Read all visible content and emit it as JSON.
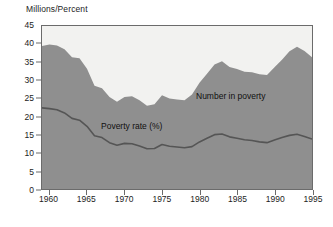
{
  "chart_data": {
    "type": "area",
    "title": "",
    "subtitle": "",
    "ylabel": "Millions/Percent",
    "xlabel": "",
    "ylim": [
      0,
      45
    ],
    "xlim": [
      1959,
      1995
    ],
    "grid": false,
    "legend_position": "inline-annotations",
    "yticks": [
      0,
      5,
      10,
      15,
      20,
      25,
      30,
      35,
      40,
      45
    ],
    "ytick_labels": [
      "0",
      "5",
      "10",
      "15",
      "20",
      "25",
      "30",
      "35",
      "40",
      "45"
    ],
    "xticks": [
      1960,
      1965,
      1970,
      1975,
      1980,
      1985,
      1990,
      1995
    ],
    "xtick_labels": [
      "1960",
      "1965",
      "1970",
      "1975",
      "1980",
      "1985",
      "1990",
      "1995"
    ],
    "x": [
      1959,
      1960,
      1961,
      1962,
      1963,
      1964,
      1965,
      1966,
      1967,
      1968,
      1969,
      1970,
      1971,
      1972,
      1973,
      1974,
      1975,
      1976,
      1977,
      1978,
      1979,
      1980,
      1981,
      1982,
      1983,
      1984,
      1985,
      1986,
      1987,
      1988,
      1989,
      1990,
      1991,
      1992,
      1993,
      1994,
      1995
    ],
    "series": [
      {
        "name": "Number in poverty",
        "label": "Number in poverty",
        "unit": "millions",
        "render": "area",
        "fill_color": "#8f8f8f",
        "values": [
          39.5,
          39.9,
          39.6,
          38.6,
          36.4,
          36.1,
          33.2,
          28.5,
          27.8,
          25.4,
          24.1,
          25.4,
          25.6,
          24.5,
          23.0,
          23.4,
          25.9,
          25.0,
          24.7,
          24.5,
          26.1,
          29.3,
          31.8,
          34.4,
          35.3,
          33.7,
          33.1,
          32.4,
          32.2,
          31.7,
          31.5,
          33.6,
          35.7,
          38.0,
          39.3,
          38.1,
          36.4
        ]
      },
      {
        "name": "Poverty rate (%)",
        "label": "Poverty rate (%)",
        "unit": "percent",
        "render": "line",
        "line_color": "#555555",
        "values": [
          22.4,
          22.2,
          21.9,
          21.0,
          19.5,
          19.0,
          17.3,
          14.7,
          14.2,
          12.8,
          12.1,
          12.6,
          12.5,
          11.9,
          11.1,
          11.2,
          12.3,
          11.8,
          11.6,
          11.4,
          11.7,
          13.0,
          14.0,
          15.0,
          15.2,
          14.4,
          14.0,
          13.6,
          13.4,
          13.0,
          12.8,
          13.5,
          14.2,
          14.8,
          15.1,
          14.5,
          13.8
        ]
      }
    ]
  },
  "labels": {
    "axis_title": "Millions/Percent",
    "number_in_poverty": "Number in poverty",
    "poverty_rate": "Poverty rate (%)"
  },
  "colors": {
    "area_fill": "#8f8f8f",
    "plot_background": "#f2f2f0",
    "line": "#555555",
    "frame": "#6b6b6b",
    "text": "#1c1c1c"
  }
}
